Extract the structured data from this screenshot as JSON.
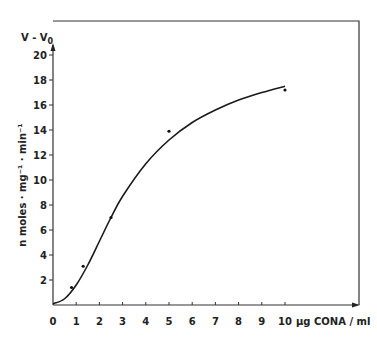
{
  "chart_data": {
    "type": "line",
    "title": "",
    "xlabel": "µg CONA / ml",
    "ylabel": "n moles · mg⁻¹ · min⁻¹",
    "y_axis_header": "V - V0",
    "xlim": [
      0,
      10
    ],
    "ylim": [
      0,
      20
    ],
    "x_ticks": [
      "0",
      "1",
      "2",
      "3",
      "4",
      "5",
      "6",
      "7",
      "8",
      "9",
      "10"
    ],
    "y_ticks": [
      "2",
      "4",
      "6",
      "8",
      "10",
      "12",
      "14",
      "16",
      "18",
      "20"
    ],
    "grid": false,
    "legend": null,
    "series": [
      {
        "name": "measured points",
        "kind": "scatter",
        "x": [
          0.8,
          1.3,
          2.5,
          5.0,
          10.0
        ],
        "y": [
          1.4,
          3.1,
          7.0,
          13.9,
          17.2
        ]
      },
      {
        "name": "fitted curve",
        "kind": "line",
        "x": [
          0,
          0.5,
          1.0,
          1.5,
          2.0,
          2.5,
          3.0,
          4.0,
          5.0,
          6.0,
          7.0,
          8.0,
          9.0,
          10.0
        ],
        "y": [
          0.1,
          0.5,
          1.6,
          3.2,
          5.1,
          7.0,
          8.7,
          11.3,
          13.2,
          14.6,
          15.6,
          16.4,
          17.0,
          17.5
        ]
      }
    ]
  }
}
